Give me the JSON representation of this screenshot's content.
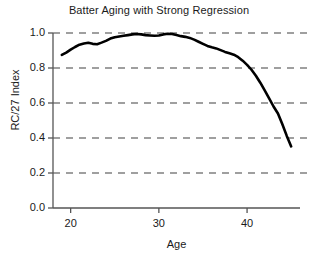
{
  "chart_data": {
    "type": "line",
    "title": "Batter Aging with Strong Regression",
    "xlabel": "Age",
    "ylabel": "RC/27 Index",
    "xlim": [
      18,
      46
    ],
    "ylim": [
      0.0,
      1.0
    ],
    "xticks": [
      20,
      30,
      40
    ],
    "xtick_labels": [
      "20",
      "30",
      "40"
    ],
    "yticks": [
      0.0,
      0.2,
      0.4,
      0.6,
      0.8,
      1.0
    ],
    "ytick_labels": [
      "0.0",
      "0.2",
      "0.4",
      "0.6",
      "0.8",
      "1.0"
    ],
    "grid": "horizontal-dashed",
    "legend": "none",
    "line_color": "#000000",
    "line_width": 2.6,
    "grid_color": "#808080",
    "axis_color": "#555555",
    "series": [
      {
        "name": "RC/27 Index",
        "x": [
          19.0,
          19.5,
          20.0,
          20.5,
          21.0,
          21.5,
          22.0,
          22.5,
          23.0,
          23.5,
          24.0,
          24.5,
          25.0,
          25.5,
          26.0,
          26.5,
          27.0,
          27.5,
          28.0,
          28.5,
          29.0,
          29.5,
          30.0,
          30.5,
          31.0,
          31.5,
          32.0,
          32.5,
          33.0,
          33.5,
          34.0,
          34.5,
          35.0,
          35.5,
          36.0,
          36.5,
          37.0,
          37.5,
          38.0,
          38.5,
          39.0,
          39.5,
          40.0,
          40.5,
          41.0,
          41.5,
          42.0,
          42.5,
          43.0,
          43.5,
          44.0,
          44.5,
          45.0
        ],
        "y": [
          0.875,
          0.888,
          0.905,
          0.92,
          0.933,
          0.94,
          0.944,
          0.938,
          0.936,
          0.945,
          0.955,
          0.968,
          0.976,
          0.98,
          0.984,
          0.988,
          0.992,
          0.994,
          0.992,
          0.988,
          0.986,
          0.984,
          0.986,
          0.992,
          0.996,
          0.994,
          0.988,
          0.982,
          0.978,
          0.972,
          0.962,
          0.95,
          0.938,
          0.926,
          0.918,
          0.912,
          0.902,
          0.892,
          0.884,
          0.876,
          0.862,
          0.842,
          0.818,
          0.79,
          0.756,
          0.716,
          0.672,
          0.626,
          0.58,
          0.54,
          0.478,
          0.412,
          0.352
        ]
      }
    ]
  }
}
